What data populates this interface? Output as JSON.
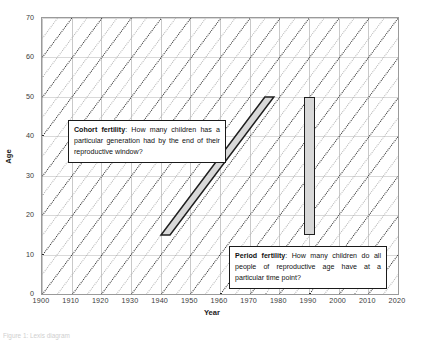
{
  "chart_data": {
    "type": "line",
    "title": "",
    "xlabel": "Year",
    "ylabel": "Age",
    "xlim": [
      1900,
      2020
    ],
    "ylim": [
      0,
      70
    ],
    "xticks": [
      1900,
      1910,
      1920,
      1930,
      1940,
      1950,
      1960,
      1970,
      1980,
      1990,
      2000,
      2010,
      2020
    ],
    "yticks": [
      0,
      10,
      20,
      30,
      40,
      50,
      60,
      70
    ],
    "xtick_step": 10,
    "ytick_step": 10,
    "grid": true,
    "legend": "none",
    "diagonal_cohort_lines": {
      "description": "Dotted 45-degree lines of constant birth cohort",
      "birth_year_start": 1830,
      "birth_year_end": 2020,
      "spacing_years": 5,
      "emphasized_every_years": 10,
      "light_color": "#b4b4b4",
      "dark_color": "#2a2a2a"
    },
    "series": [
      {
        "name": "Cohort fertility",
        "shape": "diagonal-parallelogram",
        "birth_cohort": 1925,
        "age_start": 15,
        "age_end": 50,
        "year_start": 1940,
        "year_end": 1975,
        "fill": "#d8d8d8",
        "stroke": "#1f1f1f"
      },
      {
        "name": "Period fertility",
        "shape": "vertical-bar",
        "year": 1990,
        "age_start": 15,
        "age_end": 50,
        "fill": "#d8d8d8",
        "stroke": "#1f1f1f"
      }
    ],
    "annotations": [
      {
        "id": "cohort",
        "lead": "Cohort fertility",
        "text": ": How many children has a particular generation had by the end of their reproductive window?"
      },
      {
        "id": "period",
        "lead": "Period fertility",
        "text": ": How many children do all people of reproductive age have at a particular time point?"
      }
    ]
  },
  "axis": {
    "x_title": "Year",
    "y_title": "Age",
    "x_tick_labels": [
      "1900",
      "1910",
      "1920",
      "1930",
      "1940",
      "1950",
      "1960",
      "1970",
      "1980",
      "1990",
      "2000",
      "2010",
      "2020"
    ],
    "y_tick_labels": [
      "0",
      "10",
      "20",
      "30",
      "40",
      "50",
      "60",
      "70"
    ]
  },
  "callouts": {
    "cohort": {
      "lead": "Cohort fertility",
      "body": ": How many children has a particular generation had by the end of their reproductive window?"
    },
    "period": {
      "lead": "Period fertility",
      "body": ": How many children do all people of reproductive age have at a particular time point?"
    }
  },
  "caption": {
    "text": "Figure 1: Lexis diagram"
  }
}
